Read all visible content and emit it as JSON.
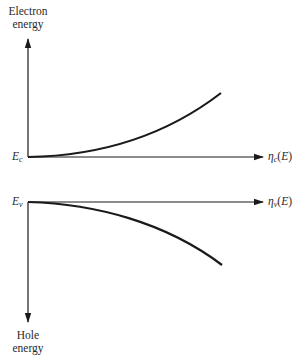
{
  "diagram": {
    "top_panel": {
      "y_axis_label_line1": "Electron",
      "y_axis_label_line2": "energy",
      "origin_label_main": "E",
      "origin_label_sub": "c",
      "x_axis_label_main": "η",
      "x_axis_label_sub": "c",
      "x_axis_label_arg_open": "(",
      "x_axis_label_arg": "E",
      "x_axis_label_arg_close": ")",
      "curve": "increasing, concave-up from origin (density of states in conduction band)"
    },
    "bottom_panel": {
      "y_axis_label_line1": "Hole",
      "y_axis_label_line2": "energy",
      "origin_label_main": "E",
      "origin_label_sub": "v",
      "x_axis_label_main": "η",
      "x_axis_label_sub": "v",
      "x_axis_label_arg_open": "(",
      "x_axis_label_arg": "E",
      "x_axis_label_arg_close": ")",
      "curve": "decreasing, concave-down from origin (density of states in valence band, mirrored)"
    },
    "colors": {
      "line": "#1a1a1a",
      "background": "#ffffff",
      "text": "#2a2a2a"
    }
  }
}
